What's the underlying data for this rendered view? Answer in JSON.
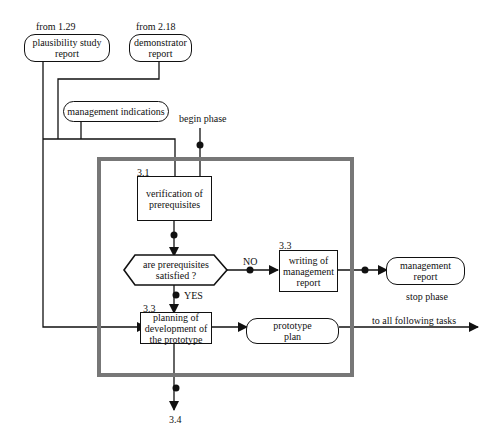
{
  "inputs": {
    "plausibility": {
      "source": "from 1.29",
      "label_line1": "plausibility study",
      "label_line2": "report"
    },
    "demonstrator": {
      "source": "from 2.18",
      "label_line1": "demonstrator",
      "label_line2": "report"
    },
    "management_indications": {
      "label": "management indications"
    }
  },
  "begin_phase": "begin phase",
  "steps": {
    "verification": {
      "number": "3.1",
      "line1": "verification of",
      "line2": "prerequisites"
    },
    "decision": {
      "line1": "are prerequisites",
      "line2": "satisfied  ?",
      "no_label": "NO",
      "yes_label": "YES"
    },
    "writing": {
      "number": "3.3",
      "line1": "writing of",
      "line2": "management",
      "line3": "report"
    },
    "planning": {
      "number": "3.3",
      "line1": "planning of",
      "line2": "development of",
      "line3": "the prototype"
    }
  },
  "outputs": {
    "management_report": {
      "line1": "management",
      "line2": "report",
      "note": "stop phase"
    },
    "prototype_plan": {
      "line1": "prototype",
      "line2": "plan"
    },
    "following": "to all following tasks",
    "next_task": "3.4"
  }
}
